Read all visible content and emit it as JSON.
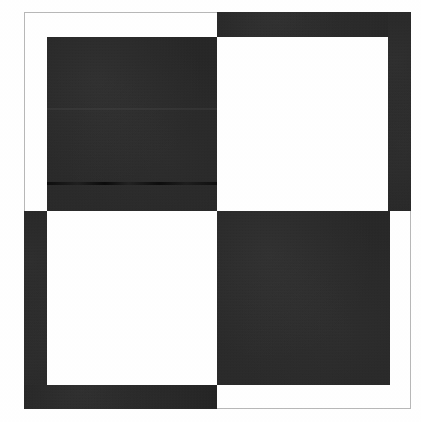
{
  "figure": {
    "title": "Checkerboard pinwheel figure",
    "description": "Abstract black-and-white geometric figure: an interlocking two-by-two checkerboard of dark blocks on white paper, enclosed by a thin gray scan frame.",
    "canvas": {
      "width": 421,
      "height": 422,
      "background": "#ffffff"
    },
    "colors": {
      "ink": "#1f1f1f",
      "paper": "#ffffff",
      "frame": "#b8b8b8",
      "artifact": "#000000"
    },
    "frame": {
      "label": "outer scan frame",
      "x": 24,
      "y": 12,
      "width": 387,
      "height": 397,
      "stroke": "#b8b8b8",
      "stroke_width": 1
    },
    "grid": {
      "label": "checkerboard crossing",
      "center_x": 217,
      "center_y": 211,
      "inner_left": 47,
      "inner_right": 390,
      "inner_top": 37,
      "inner_bottom": 385
    },
    "tiles": [
      {
        "name": "top-left-block",
        "quadrant": "top-left",
        "shape": "square",
        "x": 47,
        "y": 37,
        "width": 170,
        "height": 174,
        "color": "#232323"
      },
      {
        "name": "top-right-band",
        "quadrant": "top-right",
        "shape": "horizontal-band",
        "x": 217,
        "y": 12,
        "width": 194,
        "height": 25,
        "color": "#202020"
      },
      {
        "name": "right-band",
        "quadrant": "top-right",
        "shape": "vertical-band",
        "x": 388,
        "y": 12,
        "width": 23,
        "height": 199,
        "color": "#212121"
      },
      {
        "name": "left-band",
        "quadrant": "bottom-left",
        "shape": "vertical-band",
        "x": 24,
        "y": 211,
        "width": 23,
        "height": 198,
        "color": "#202020"
      },
      {
        "name": "bottom-band",
        "quadrant": "bottom-left",
        "shape": "horizontal-band",
        "x": 24,
        "y": 385,
        "width": 193,
        "height": 24,
        "color": "#1e1e1e"
      },
      {
        "name": "bottom-right-block",
        "quadrant": "bottom-right",
        "shape": "square",
        "x": 217,
        "y": 211,
        "width": 173,
        "height": 174,
        "color": "#242424"
      }
    ],
    "artifacts": [
      {
        "name": "scanline-artifact",
        "type": "horizontal dark streak",
        "x": 47,
        "y": 182,
        "width": 170,
        "height": 3
      },
      {
        "name": "seam-artifact",
        "type": "faint horizontal seam",
        "x": 47,
        "y": 108,
        "width": 170,
        "height": 2
      }
    ]
  }
}
